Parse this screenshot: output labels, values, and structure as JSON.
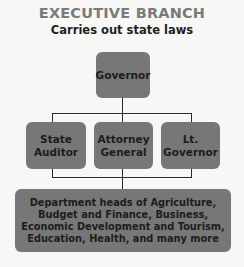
{
  "header": {
    "title": "EXECUTIVE BRANCH",
    "subtitle": "Carries out state laws"
  },
  "org_chart": {
    "top": {
      "label": "Governor"
    },
    "middle": [
      {
        "line1": "State",
        "line2": "Auditor"
      },
      {
        "line1": "Attorney",
        "line2": "General"
      },
      {
        "line1": "Lt.",
        "line2": "Governor"
      }
    ],
    "bottom": {
      "lines": [
        "Department heads of Agriculture,",
        "Budget and Finance, Business,",
        "Economic Development and Tourism,",
        "Education, Health, and many more"
      ]
    }
  },
  "colors": {
    "background": "#f7f7f6",
    "box_fill": "#777777",
    "title": "#7a7a7a",
    "text": "#1c1c1c",
    "connector": "#2a2a2a"
  }
}
